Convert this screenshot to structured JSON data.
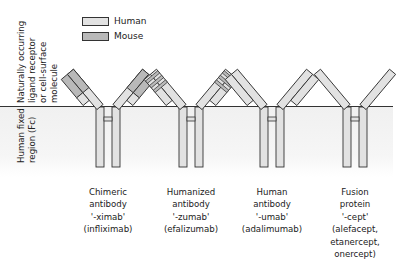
{
  "legend": {
    "items": [
      {
        "label": "Human",
        "color": "#e2e2e2"
      },
      {
        "label": "Mouse",
        "color": "#b9b9b9"
      }
    ]
  },
  "regions": {
    "top": {
      "lines": [
        "Naturally occurring",
        "ligand receptor",
        "or cell-surface",
        "molecule"
      ]
    },
    "bottom": {
      "lines": [
        "Human fixed",
        "region (Fc)"
      ]
    }
  },
  "colors": {
    "human": "#e2e2e2",
    "mouse": "#b9b9b9",
    "outline": "#333333",
    "fc_background": "#f2f2f2"
  },
  "molecules": [
    {
      "type": "chimeric",
      "lines": [
        "Chimeric",
        "antibody",
        "'-ximab'",
        "(infliximab)"
      ]
    },
    {
      "type": "humanized",
      "lines": [
        "Humanized",
        "antibody",
        "'-zumab'",
        "(efalizumab)"
      ]
    },
    {
      "type": "human",
      "lines": [
        "Human",
        "antibody",
        "'-umab'",
        "(adalimumab)"
      ]
    },
    {
      "type": "fusion",
      "lines": [
        "Fusion",
        "protein",
        "'-cept'",
        "(alefacept,",
        "etanercept,",
        "onercept)"
      ]
    }
  ]
}
